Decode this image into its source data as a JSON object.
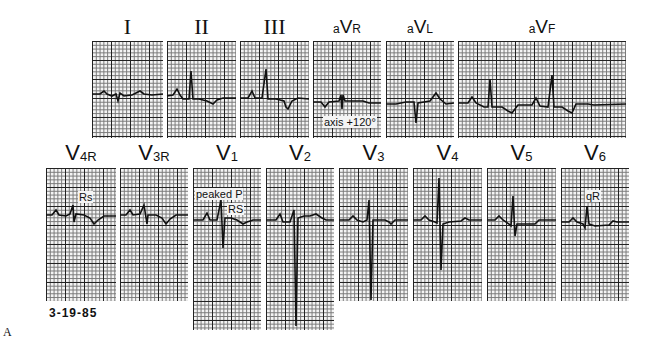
{
  "figure": {
    "panel_letter": "A",
    "date": "3-19-85",
    "limb_leads": [
      {
        "id": "I",
        "label": "I",
        "style": "roman"
      },
      {
        "id": "II",
        "label": "II",
        "style": "roman"
      },
      {
        "id": "III",
        "label": "III",
        "style": "roman"
      },
      {
        "id": "aVR",
        "prefix": "a",
        "main": "V",
        "sub": "R",
        "style": "av",
        "annotation": "axis +120°"
      },
      {
        "id": "aVL",
        "prefix": "a",
        "main": "V",
        "sub": "L",
        "style": "av"
      },
      {
        "id": "aVF",
        "prefix": "a",
        "main": "V",
        "sub": "F",
        "style": "av"
      }
    ],
    "chest_leads": [
      {
        "id": "V4R",
        "main": "V",
        "sub": "4R",
        "annotation": "Rs"
      },
      {
        "id": "V3R",
        "main": "V",
        "sub": "3R"
      },
      {
        "id": "V1",
        "main": "V",
        "sub": "1",
        "annotation": "peaked P",
        "annotation2": "RS"
      },
      {
        "id": "V2",
        "main": "V",
        "sub": "2"
      },
      {
        "id": "V3",
        "main": "V",
        "sub": "3"
      },
      {
        "id": "V4",
        "main": "V",
        "sub": "4"
      },
      {
        "id": "V5",
        "main": "V",
        "sub": "5"
      },
      {
        "id": "V6",
        "main": "V",
        "sub": "6",
        "annotation": "qR"
      }
    ]
  }
}
